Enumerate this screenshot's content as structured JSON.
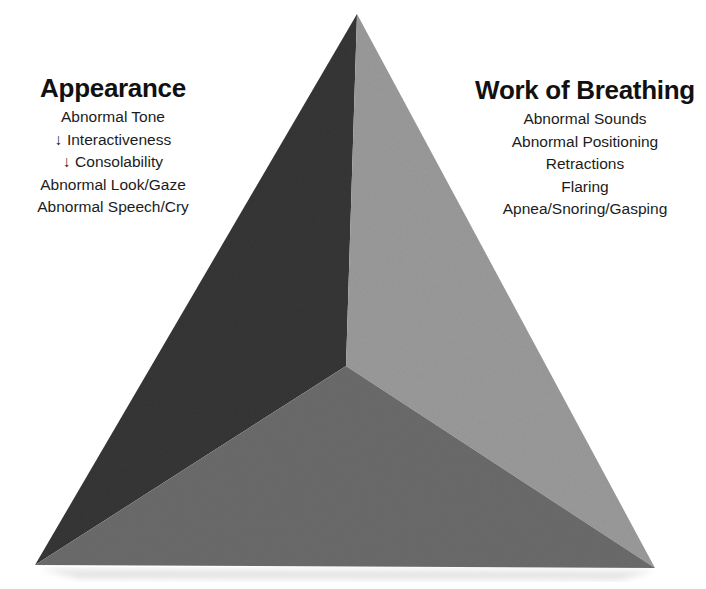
{
  "diagram": {
    "type": "pediatric-assessment-triangle",
    "faces": {
      "left": {
        "color": "#353535"
      },
      "right": {
        "color": "#9a9a9a"
      },
      "bottom": {
        "color": "#6b6b6b"
      }
    },
    "shadow_color": "#e6e6e6"
  },
  "appearance": {
    "title": "Appearance",
    "items": [
      "Abnormal Tone",
      "↓ Interactiveness",
      "↓ Consolability",
      "Abnormal Look/Gaze",
      "Abnormal Speech/Cry"
    ]
  },
  "work_of_breathing": {
    "title": "Work of Breathing",
    "items": [
      "Abnormal Sounds",
      "Abnormal Positioning",
      "Retractions",
      "Flaring",
      "Apnea/Snoring/Gasping"
    ]
  }
}
